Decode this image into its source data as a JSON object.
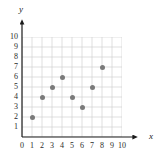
{
  "chart_data": {
    "type": "scatter",
    "title": "",
    "xlabel": "x",
    "ylabel": "y",
    "x": [
      1,
      2,
      3,
      4,
      5,
      6,
      7,
      8
    ],
    "values": [
      2,
      4,
      5,
      6,
      4,
      3,
      5,
      7
    ],
    "points": [
      {
        "x": 1,
        "y": 2
      },
      {
        "x": 2,
        "y": 4
      },
      {
        "x": 3,
        "y": 5
      },
      {
        "x": 4,
        "y": 6
      },
      {
        "x": 5,
        "y": 4
      },
      {
        "x": 6,
        "y": 3
      },
      {
        "x": 7,
        "y": 5
      },
      {
        "x": 8,
        "y": 7
      }
    ],
    "xlim": [
      0,
      10
    ],
    "ylim": [
      0,
      10
    ],
    "xticks": [
      "0",
      "1",
      "2",
      "3",
      "4",
      "5",
      "6",
      "7",
      "8",
      "9",
      "10"
    ],
    "yticks": [
      "1",
      "2",
      "3",
      "4",
      "5",
      "6",
      "7",
      "8",
      "9",
      "10"
    ],
    "grid": true,
    "legend": null,
    "marker_color": "#7a7a7a",
    "grid_color": "#c9c9c9",
    "axis_color": "#1a1a1a"
  },
  "axes": {
    "x_name": "x",
    "y_name": "y"
  }
}
